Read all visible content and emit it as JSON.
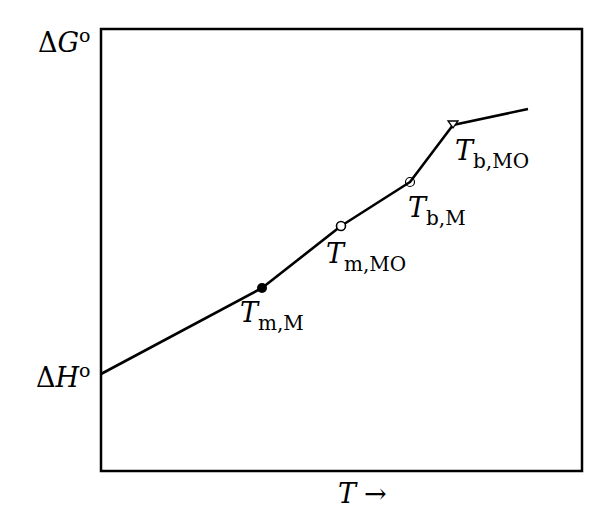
{
  "chart_data": {
    "type": "line",
    "title": "",
    "ylabel": {
      "delta": "Δ",
      "symbol": "G",
      "sup": "o"
    },
    "xlabel": {
      "symbol": "T",
      "arrow": "→"
    },
    "y_intercept_label": {
      "delta": "Δ",
      "symbol": "H",
      "sup": "o"
    },
    "grid": false,
    "legend": null,
    "axis_ticks": [],
    "frame_px": {
      "left": 101,
      "top": 29,
      "right": 582,
      "bottom": 471
    },
    "line_points_px": [
      [
        101,
        374
      ],
      [
        262,
        288
      ],
      [
        341,
        226
      ],
      [
        410,
        182
      ],
      [
        453,
        125
      ],
      [
        528,
        109
      ]
    ],
    "transitions": [
      {
        "id": "tm_m",
        "label_main": "T",
        "label_sub": "m,M",
        "marker": "filled-circle",
        "x": 262,
        "y": 288,
        "label_x": 240,
        "label_y": 322
      },
      {
        "id": "tm_mo",
        "label_main": "T",
        "label_sub": "m,MO",
        "marker": "open-circle",
        "x": 341,
        "y": 226,
        "label_x": 326,
        "label_y": 263
      },
      {
        "id": "tb_m",
        "label_main": "T",
        "label_sub": "b,M",
        "marker": "circled-dot",
        "x": 410,
        "y": 182,
        "label_x": 408,
        "label_y": 217
      },
      {
        "id": "tb_mo",
        "label_main": "T",
        "label_sub": "b,MO",
        "marker": "open-triangle-down",
        "x": 453,
        "y": 125,
        "label_x": 455,
        "label_y": 160
      }
    ]
  }
}
